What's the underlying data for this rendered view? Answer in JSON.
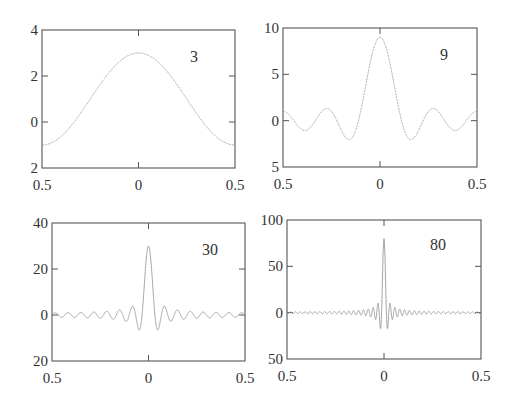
{
  "chart_data": [
    {
      "type": "line",
      "title": "",
      "annotation": "3",
      "N": 3,
      "function": "sin(N*pi*x)/sin(pi*x)",
      "xlabel": "",
      "ylabel": "",
      "xlim": [
        -0.5,
        0.5
      ],
      "ylim": [
        -2,
        4
      ],
      "xticks": [
        -0.5,
        0,
        0.5
      ],
      "xtick_labels": [
        "0.5",
        "0",
        "0.5"
      ],
      "yticks": [
        4,
        2,
        0,
        -2
      ],
      "ytick_labels": [
        "4",
        "2",
        "0",
        "2"
      ],
      "peak": 3,
      "x": [
        -0.5,
        -0.4,
        -0.3,
        -0.2,
        -0.1,
        0,
        0.1,
        0.2,
        0.3,
        0.4,
        0.5
      ],
      "values": [
        -1,
        -0.62,
        0.24,
        1.24,
        2.24,
        3,
        2.24,
        1.24,
        0.24,
        -0.62,
        -1
      ],
      "box": {
        "x": 42,
        "y": 30,
        "w": 193,
        "h": 138
      },
      "label_pos": {
        "x": 190,
        "y": 62
      }
    },
    {
      "type": "line",
      "title": "",
      "annotation": "9",
      "N": 9,
      "function": "sin(N*pi*x)/sin(pi*x)",
      "xlim": [
        -0.5,
        0.5
      ],
      "ylim": [
        -5,
        10
      ],
      "xticks": [
        -0.5,
        0,
        0.5
      ],
      "xtick_labels": [
        "0.5",
        "0",
        "0.5"
      ],
      "yticks": [
        10,
        5,
        0,
        -5
      ],
      "ytick_labels": [
        "10",
        "5",
        "0",
        "5"
      ],
      "peak": 9,
      "x": [
        -0.5,
        -0.4,
        -0.3,
        -0.2,
        -0.1,
        0,
        0.1,
        0.2,
        0.3,
        0.4,
        0.5
      ],
      "values": [
        1,
        -1.05,
        1.24,
        -1.7,
        3.24,
        9,
        3.24,
        -1.7,
        1.24,
        -1.05,
        1
      ],
      "box": {
        "x": 283,
        "y": 28,
        "w": 194,
        "h": 139
      },
      "label_pos": {
        "x": 440,
        "y": 60
      }
    },
    {
      "type": "line",
      "title": "",
      "annotation": "30",
      "N": 30,
      "function": "sin(N*pi*x)/sin(pi*x)",
      "xlim": [
        -0.5,
        0.5
      ],
      "ylim": [
        -20,
        40
      ],
      "xticks": [
        -0.5,
        0,
        0.5
      ],
      "xtick_labels": [
        "0.5",
        "0",
        "0.5"
      ],
      "yticks": [
        40,
        20,
        0,
        -20
      ],
      "ytick_labels": [
        "40",
        "20",
        "0",
        "20"
      ],
      "peak": 30,
      "x": [
        -0.5,
        -0.1,
        -0.05,
        0,
        0.05,
        0.1,
        0.5
      ],
      "values": [
        0,
        0,
        -6.4,
        30,
        -6.4,
        0,
        0
      ],
      "box": {
        "x": 52,
        "y": 223,
        "w": 193,
        "h": 138
      },
      "label_pos": {
        "x": 202,
        "y": 255
      }
    },
    {
      "type": "line",
      "title": "",
      "annotation": "80",
      "N": 80,
      "function": "sin(N*pi*x)/sin(pi*x)",
      "xlim": [
        -0.5,
        0.5
      ],
      "ylim": [
        -50,
        100
      ],
      "xticks": [
        -0.5,
        0,
        0.5
      ],
      "xtick_labels": [
        "0.5",
        "0",
        "0.5"
      ],
      "yticks": [
        100,
        50,
        0,
        -50
      ],
      "ytick_labels": [
        "100",
        "50",
        "0",
        "50"
      ],
      "peak": 80,
      "x": [
        -0.5,
        -0.02,
        0,
        0.02,
        0.5
      ],
      "values": [
        0,
        -17,
        80,
        -17,
        0
      ],
      "box": {
        "x": 287,
        "y": 220,
        "w": 194,
        "h": 139
      },
      "label_pos": {
        "x": 430,
        "y": 250
      }
    }
  ],
  "colors": {
    "axis": "#555555",
    "curve": "#9a9a9a",
    "text": "#333333"
  }
}
